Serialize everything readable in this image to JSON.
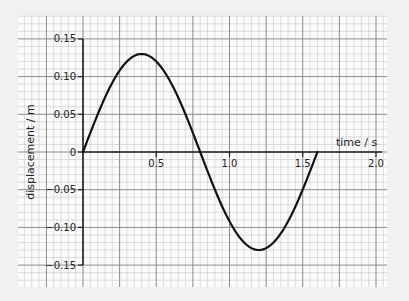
{
  "chart_data": {
    "type": "line",
    "title": "",
    "xlabel": "time / s",
    "ylabel": "displacement / m",
    "xlim": [
      0,
      2.0
    ],
    "ylim": [
      -0.15,
      0.15
    ],
    "x_ticks": [
      0.5,
      1.0,
      1.5,
      2.0
    ],
    "x_tick_labels": [
      "0.5",
      "1.0",
      "1.5",
      "2.0"
    ],
    "y_ticks": [
      0.15,
      0.1,
      0.05,
      0,
      -0.05,
      -0.1,
      -0.15
    ],
    "y_tick_labels": [
      "0.15",
      "0.10",
      "0.05",
      "0",
      "-0.05",
      "-0.10",
      "-0.15"
    ],
    "grid": true,
    "legend": null,
    "series": [
      {
        "name": "displacement",
        "description": "one full sine cycle, amplitude 0.13 m, period 1.6 s",
        "amplitude": 0.13,
        "period": 1.6,
        "x": [
          0,
          0.1,
          0.2,
          0.3,
          0.4,
          0.5,
          0.6,
          0.7,
          0.8,
          0.9,
          1.0,
          1.1,
          1.2,
          1.3,
          1.4,
          1.5,
          1.6
        ],
        "y": [
          0,
          0.05,
          0.092,
          0.12,
          0.13,
          0.12,
          0.092,
          0.05,
          0,
          -0.05,
          -0.092,
          -0.12,
          -0.13,
          -0.12,
          -0.092,
          -0.05,
          0
        ]
      }
    ]
  },
  "layout": {
    "grid_left": 18,
    "grid_top": 16,
    "grid_right": 387,
    "grid_bottom": 287,
    "origin_x": 83,
    "origin_y": 152,
    "px_per_second": 146.5,
    "px_per_metre": 754,
    "curve_color": "#111111",
    "minor_grid_color": "#c8c8c8",
    "major_grid_color": "#8a8a8a",
    "axis_color": "#222222"
  }
}
